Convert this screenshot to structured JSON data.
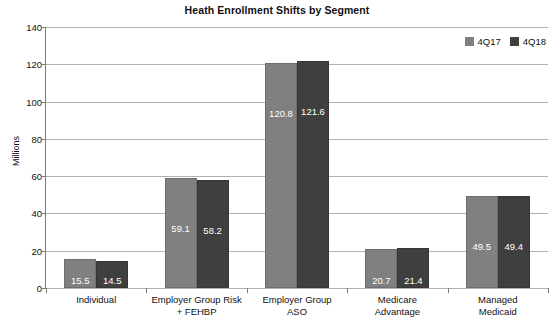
{
  "chart_data": {
    "type": "bar",
    "title": "Heath Enrollment Shifts by Segment",
    "xlabel": "",
    "ylabel": "Millions",
    "ylim": [
      0,
      140
    ],
    "ytick_step": 20,
    "yticks": [
      "140",
      "120",
      "100",
      "80",
      "60",
      "40",
      "20",
      "0"
    ],
    "grid": "horizontal",
    "legend_position": "top-right",
    "categories": [
      "Individual",
      "Employer Group Risk + FEHBP",
      "Employer Group ASO",
      "Medicare Advantage",
      "Managed Medicaid"
    ],
    "category_lines": [
      [
        "Individual"
      ],
      [
        "Employer Group Risk",
        "+ FEHBP"
      ],
      [
        "Employer Group",
        "ASO"
      ],
      [
        "Medicare",
        "Advantage"
      ],
      [
        "Managed",
        "Medicaid"
      ]
    ],
    "series": [
      {
        "name": "4Q17",
        "color": "#808080",
        "values": [
          15.5,
          59.1,
          120.8,
          20.7,
          49.5
        ],
        "labels": [
          "15.5",
          "59.1",
          "120.8",
          "20.7",
          "49.5"
        ]
      },
      {
        "name": "4Q18",
        "color": "#3f3f3f",
        "values": [
          14.5,
          58.2,
          121.6,
          21.4,
          49.4
        ],
        "labels": [
          "14.5",
          "58.2",
          "121.6",
          "21.4",
          "49.4"
        ]
      }
    ]
  }
}
